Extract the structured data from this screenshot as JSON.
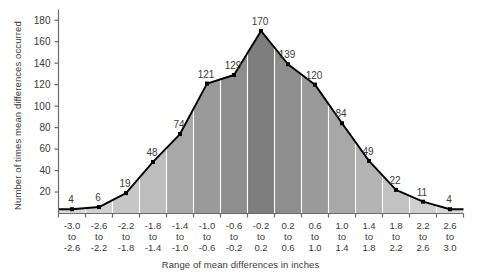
{
  "chart_data": {
    "type": "bar",
    "title": "",
    "xlabel": "Range of mean differences in inches",
    "ylabel": "Number of times mean differences occurred",
    "categories": [
      "-3.0 to -2.6",
      "-2.6 to -2.2",
      "-2.2 to -1.8",
      "-1.8 to -1.4",
      "-1.4 to -1.0",
      "-1.0 to -0.6",
      "-0.6 to -0.2",
      "-0.2 to 0.2",
      "0.2 to 0.6",
      "0.6 to 1.0",
      "1.0 to 1.4",
      "1.4 to 1.8",
      "1.8 to 2.2",
      "2.2 to 2.6",
      "2.6 to 3.0"
    ],
    "category_lines": [
      [
        "-3.0",
        "to",
        "-2.6"
      ],
      [
        "-2.6",
        "to",
        "-2.2"
      ],
      [
        "-2.2",
        "to",
        "-1.8"
      ],
      [
        "-1.8",
        "to",
        "-1.4"
      ],
      [
        "-1.4",
        "to",
        "-1.0"
      ],
      [
        "-1.0",
        "to",
        "-0.6"
      ],
      [
        "-0.6",
        "to",
        "-0.2"
      ],
      [
        "-0.2",
        "to",
        "0.2"
      ],
      [
        "0.2",
        "to",
        "0.6"
      ],
      [
        "0.6",
        "to",
        "1.0"
      ],
      [
        "1.0",
        "to",
        "1.4"
      ],
      [
        "1.4",
        "to",
        "1.8"
      ],
      [
        "1.8",
        "to",
        "2.2"
      ],
      [
        "2.2",
        "to",
        "2.6"
      ],
      [
        "2.6",
        "to",
        "3.0"
      ]
    ],
    "values": [
      4,
      6,
      19,
      48,
      74,
      121,
      129,
      170,
      139,
      120,
      84,
      49,
      22,
      11,
      4
    ],
    "bar_colors": [
      "#d8d8d8",
      "#d0d0d0",
      "#c6c6c6",
      "#bdbdbd",
      "#a8a8a8",
      "#9a9a9a",
      "#8e8e8e",
      "#7e7e7e",
      "#8e8e8e",
      "#9a9a9a",
      "#a8a8a8",
      "#b4b4b4",
      "#c2c2c2",
      "#cfcfcf",
      "#d8d8d8"
    ],
    "ylim": [
      0,
      190
    ],
    "yticks": [
      0,
      20,
      40,
      60,
      80,
      100,
      120,
      140,
      160,
      180
    ],
    "ytick_labels": [
      "",
      "20",
      "40",
      "60",
      "80",
      "100",
      "120",
      "140",
      "160",
      "180"
    ],
    "grid": false,
    "legend": null,
    "line_color": "#000000",
    "marker_color": "#000000",
    "axis_color": "#6b6b6b",
    "label_color": "#3a3a3a"
  }
}
